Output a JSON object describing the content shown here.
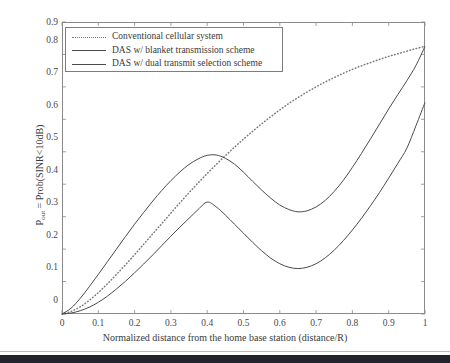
{
  "chart_data": {
    "type": "line",
    "title": "",
    "xlabel": "Normalized distance from the home base station (distance/R)",
    "ylabel": "P_out = Prob(SINR<10dB)",
    "ylabel_base": "P",
    "ylabel_sub": "out",
    "ylabel_rest": " = Prob(SINR<10dB)",
    "xlim": [
      0,
      1
    ],
    "ylim": [
      0,
      0.9
    ],
    "grid": false,
    "legend_position": "upper-left-inside",
    "xticks": [
      0,
      0.1,
      0.2,
      0.3,
      0.4,
      0.5,
      0.6,
      0.7,
      0.8,
      0.9,
      1
    ],
    "xtick_labels": [
      "0",
      "0.1",
      "0.2",
      "0.3",
      "0.4",
      "0.5",
      "0.6",
      "0.7",
      "0.8",
      "0.9",
      "1"
    ],
    "yticks": [
      0,
      0.1,
      0.2,
      0.3,
      0.4,
      0.5,
      0.6,
      0.7,
      0.8,
      0.9
    ],
    "ytick_labels": [
      "0",
      "0.1",
      "0.2",
      "0.3",
      "0.4",
      "0.5",
      "0.6",
      "0.7",
      "0.8",
      "0.9"
    ],
    "x": [
      0,
      0.025,
      0.05,
      0.075,
      0.1,
      0.125,
      0.15,
      0.175,
      0.2,
      0.225,
      0.25,
      0.275,
      0.3,
      0.325,
      0.35,
      0.375,
      0.4,
      0.425,
      0.45,
      0.475,
      0.5,
      0.525,
      0.55,
      0.575,
      0.6,
      0.625,
      0.65,
      0.675,
      0.7,
      0.725,
      0.75,
      0.775,
      0.8,
      0.825,
      0.85,
      0.875,
      0.9,
      0.925,
      0.95,
      0.975,
      1
    ],
    "series": [
      {
        "name": "Conventional cellular system",
        "style": "dotted",
        "color": "#7a7a7a",
        "values": [
          0,
          0.008,
          0.022,
          0.042,
          0.066,
          0.093,
          0.122,
          0.152,
          0.183,
          0.215,
          0.247,
          0.279,
          0.311,
          0.343,
          0.374,
          0.404,
          0.433,
          0.461,
          0.488,
          0.514,
          0.539,
          0.563,
          0.586,
          0.608,
          0.629,
          0.649,
          0.667,
          0.684,
          0.7,
          0.715,
          0.729,
          0.742,
          0.754,
          0.765,
          0.775,
          0.785,
          0.794,
          0.802,
          0.81,
          0.818,
          0.825
        ]
      },
      {
        "name": "DAS w/ blanket transmission scheme",
        "style": "solid",
        "color": "#4a4a4a",
        "values": [
          0,
          0.018,
          0.048,
          0.084,
          0.122,
          0.161,
          0.2,
          0.239,
          0.277,
          0.313,
          0.348,
          0.381,
          0.411,
          0.438,
          0.461,
          0.478,
          0.489,
          0.49,
          0.48,
          0.462,
          0.437,
          0.409,
          0.382,
          0.357,
          0.336,
          0.322,
          0.315,
          0.318,
          0.33,
          0.35,
          0.378,
          0.412,
          0.452,
          0.495,
          0.54,
          0.586,
          0.632,
          0.676,
          0.719,
          0.766,
          0.825
        ]
      },
      {
        "name": "DAS w/ dual transmit selection scheme",
        "style": "solid",
        "color": "#4a4a4a",
        "values": [
          0,
          0.003,
          0.01,
          0.021,
          0.036,
          0.055,
          0.077,
          0.101,
          0.127,
          0.154,
          0.182,
          0.211,
          0.24,
          0.268,
          0.295,
          0.322,
          0.345,
          0.33,
          0.305,
          0.277,
          0.249,
          0.221,
          0.195,
          0.172,
          0.155,
          0.144,
          0.14,
          0.144,
          0.155,
          0.173,
          0.197,
          0.226,
          0.259,
          0.295,
          0.334,
          0.375,
          0.419,
          0.464,
          0.511,
          0.58,
          0.652
        ]
      }
    ],
    "annotations": {
      "blanket_peak": {
        "x": 0.39,
        "y": 0.49
      },
      "blanket_min": {
        "x": 0.615,
        "y": 0.315
      },
      "dual_peak": {
        "x": 0.39,
        "y": 0.35
      },
      "dual_min": {
        "x": 0.625,
        "y": 0.14
      },
      "crossing_dotted_blanket": {
        "x": 0.43,
        "y": 0.47
      },
      "endpoint_dotted": {
        "x": 1,
        "y": 0.825
      },
      "endpoint_blanket": {
        "x": 1,
        "y": 0.825
      },
      "endpoint_dual": {
        "x": 1,
        "y": 0.652
      }
    }
  },
  "legend": {
    "items": [
      {
        "label": "Conventional cellular system",
        "style": "dotted"
      },
      {
        "label": "DAS w/ blanket transmission scheme",
        "style": "solid"
      },
      {
        "label": "DAS w/ dual transmit selection scheme",
        "style": "solid"
      }
    ]
  },
  "colors": {
    "axis": "#8a8a8a",
    "text": "#3a3a3a",
    "solid_line": "#4a4a4a",
    "dotted_line": "#7a7a7a",
    "bottom_bar": "#23242b",
    "plot_background": "#ffffff"
  }
}
